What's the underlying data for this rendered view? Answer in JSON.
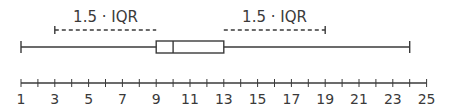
{
  "diagram": {
    "type": "box-plot",
    "annotations": {
      "left_label": "1.5 · IQR",
      "right_label": "1.5 · IQR",
      "left_range": [
        3,
        9
      ],
      "right_range": [
        13,
        19
      ]
    },
    "box": {
      "whisker_min": 1,
      "q1": 9,
      "median": 10,
      "q3": 13,
      "whisker_max": 24
    },
    "axis": {
      "min": 1,
      "max": 25,
      "minor_step": 1,
      "tick_labels": [
        "1",
        "3",
        "5",
        "7",
        "9",
        "11",
        "13",
        "15",
        "17",
        "19",
        "21",
        "23",
        "25"
      ]
    },
    "colors": {
      "line": "#3a3a3a",
      "text": "#3a3a3a",
      "background": "#ffffff"
    }
  },
  "chart_data": {
    "type": "boxplot",
    "title": "",
    "xlabel": "",
    "ylabel": "",
    "xlim": [
      1,
      25
    ],
    "grid": false,
    "boxes": [
      {
        "whisker_low": 1,
        "q1": 9,
        "median": 10,
        "q3": 13,
        "whisker_high": 24
      }
    ],
    "annotations": [
      {
        "text": "1.5 · IQR",
        "from": 3,
        "to": 9,
        "style": "dashed"
      },
      {
        "text": "1.5 · IQR",
        "from": 13,
        "to": 19,
        "style": "dashed"
      }
    ],
    "x_ticks": [
      1,
      3,
      5,
      7,
      9,
      11,
      13,
      15,
      17,
      19,
      21,
      23,
      25
    ]
  }
}
